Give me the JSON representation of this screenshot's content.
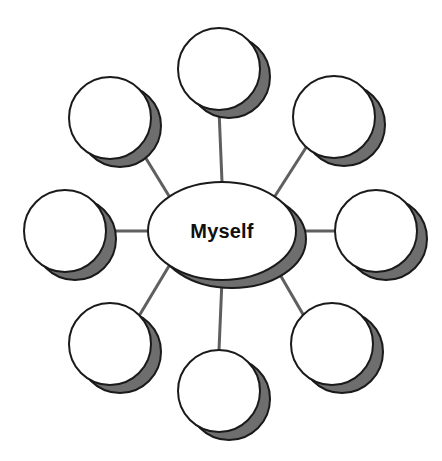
{
  "diagram": {
    "type": "web-map",
    "title": "Myself",
    "background_color": "#ffffff",
    "node_fill_color": "#ffffff",
    "node_stroke_color": "#1a1a1a",
    "shadow_color": "#6e6e6e",
    "connector_color": "#5f5f5f",
    "connector_width": 3,
    "center": {
      "label": "Myself",
      "shape": "ellipse",
      "cx": 222,
      "cy": 231,
      "rx": 74,
      "ry": 49,
      "text_color": "#101010",
      "font_size": 20
    },
    "shadow_offset": {
      "x": 10,
      "y": 8
    },
    "satellites": [
      {
        "name": "node-top",
        "label": "",
        "shape": "circle",
        "cx": 219,
        "cy": 69,
        "r": 41,
        "angle_deg": 270
      },
      {
        "name": "node-top-right",
        "label": "",
        "shape": "circle",
        "cx": 334,
        "cy": 117,
        "r": 41,
        "angle_deg": 315
      },
      {
        "name": "node-right",
        "label": "",
        "shape": "circle",
        "cx": 376,
        "cy": 231,
        "r": 41,
        "angle_deg": 0
      },
      {
        "name": "node-bottom-right",
        "label": "",
        "shape": "circle",
        "cx": 332,
        "cy": 344,
        "r": 41,
        "angle_deg": 45
      },
      {
        "name": "node-bottom",
        "label": "",
        "shape": "circle",
        "cx": 219,
        "cy": 391,
        "r": 41,
        "angle_deg": 90
      },
      {
        "name": "node-bottom-left",
        "label": "",
        "shape": "circle",
        "cx": 110,
        "cy": 344,
        "r": 41,
        "angle_deg": 135
      },
      {
        "name": "node-left",
        "label": "",
        "shape": "circle",
        "cx": 65,
        "cy": 231,
        "r": 41,
        "angle_deg": 180
      },
      {
        "name": "node-top-left",
        "label": "",
        "shape": "circle",
        "cx": 110,
        "cy": 118,
        "r": 41,
        "angle_deg": 225
      }
    ],
    "connectors": [
      {
        "name": "connector-top",
        "x1": 222,
        "y1": 182,
        "x2": 219,
        "y2": 110
      },
      {
        "name": "connector-top-right",
        "x1": 275,
        "y1": 196,
        "x2": 307,
        "y2": 146
      },
      {
        "name": "connector-right",
        "x1": 296,
        "y1": 231,
        "x2": 335,
        "y2": 231
      },
      {
        "name": "connector-bottom-right",
        "x1": 275,
        "y1": 266,
        "x2": 304,
        "y2": 316
      },
      {
        "name": "connector-bottom",
        "x1": 222,
        "y1": 280,
        "x2": 219,
        "y2": 350
      },
      {
        "name": "connector-bottom-left",
        "x1": 169,
        "y1": 266,
        "x2": 139,
        "y2": 316
      },
      {
        "name": "connector-left",
        "x1": 148,
        "y1": 231,
        "x2": 106,
        "y2": 231
      },
      {
        "name": "connector-top-left",
        "x1": 169,
        "y1": 196,
        "x2": 139,
        "y2": 147
      }
    ]
  }
}
